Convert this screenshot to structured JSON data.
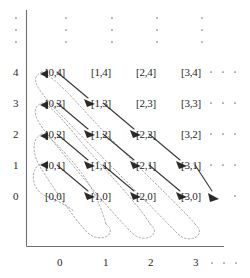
{
  "figure": {
    "type": "diagram",
    "colors": {
      "background": "#ffffff",
      "text": "#1f1f1f",
      "axis": "#6e6e6e",
      "arrow": "#3a3a3a",
      "arrow_head": "#2b2b2b",
      "dashed_loop": "#a9a9a9",
      "ellipsis": "#7a7a7a"
    }
  },
  "axes": {
    "x": {
      "tick_labels": [
        "0",
        "1",
        "2",
        "3"
      ],
      "ellipsis": "...",
      "ellipsis_dots": 3
    },
    "y": {
      "tick_labels": [
        "4",
        "3",
        "2",
        "1",
        "0"
      ],
      "ellipsis": "...",
      "ellipsis_dots": 3
    }
  },
  "grid": {
    "columns": [
      0,
      1,
      2,
      3
    ],
    "rows": [
      4,
      3,
      2,
      1,
      0
    ],
    "cells": [
      [
        "[0,4]",
        "[1,4]",
        "[2,4]",
        "[3,4]"
      ],
      [
        "[0,3]",
        "[1,3]",
        "[2,3]",
        "[3,3]"
      ],
      [
        "[0,2]",
        "[1,2]",
        "[2,2]",
        "[3,2]"
      ],
      [
        "[0,1]",
        "[1,1]",
        "[2,1]",
        "[3,1]"
      ],
      [
        "[0,0]",
        "[1,0]",
        "[2,0]",
        "[3,0]"
      ]
    ],
    "row_ellipsis": [
      "...",
      "...",
      "...",
      "...",
      "..."
    ],
    "column_ellipsis": [
      ".",
      ".",
      ".",
      "."
    ]
  },
  "labels": {
    "cell_0_4": "[0,4]",
    "cell_1_4": "[1,4]",
    "cell_2_4": "[2,4]",
    "cell_3_4": "[3,4]",
    "cell_0_3": "[0,3]",
    "cell_1_3": "[1,3]",
    "cell_2_3": "[2,3]",
    "cell_3_3": "[3,3]",
    "cell_0_2": "[0,2]",
    "cell_1_2": "[1,2]",
    "cell_2_2": "[2,2]",
    "cell_3_2": "[3,2]",
    "cell_0_1": "[0,1]",
    "cell_1_1": "[1,1]",
    "cell_2_1": "[2,1]",
    "cell_3_1": "[3,1]",
    "cell_0_0": "[0,0]",
    "cell_1_0": "[1,0]",
    "cell_2_0": "[2,0]",
    "cell_3_0": "[3,0]",
    "xtick_0": "0",
    "xtick_1": "1",
    "xtick_2": "2",
    "xtick_3": "3",
    "ytick_4": "4",
    "ytick_3": "3",
    "ytick_2": "2",
    "ytick_1": "1",
    "ytick_0": "0"
  }
}
